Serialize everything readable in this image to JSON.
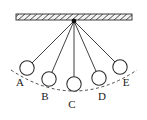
{
  "figure": {
    "type": "physics-diagram",
    "width": 147,
    "height": 120,
    "background_color": "#ffffff"
  },
  "ceiling": {
    "name": "hatched support ceiling",
    "x": 16,
    "y": 14,
    "width": 116,
    "height": 6,
    "hatch_direction": "lower-left-to-upper-right",
    "hatch_spacing": 6,
    "line_color": "#2b2b2b",
    "fill_color": "#f2f2f2"
  },
  "pivot": {
    "name": "suspension point",
    "x": 74,
    "y": 21,
    "radius": 2.2,
    "color": "#111111"
  },
  "arc": {
    "name": "swing path",
    "style": "dashed",
    "color": "#3a3a3a",
    "dash_pattern": "3 2.6",
    "start_x": 11,
    "start_y": 70,
    "end_x": 137,
    "end_y": 70,
    "control_x": 74,
    "control_y": 112
  },
  "string_color": "#2b2b2b",
  "bob": {
    "radius": 7.2,
    "fill_color": "#ffffff",
    "stroke_color": "#2b2b2b"
  },
  "positions": [
    {
      "label": "A",
      "cx": 27,
      "cy": 68,
      "label_x": 20,
      "label_y": 86
    },
    {
      "label": "B",
      "cx": 49,
      "cy": 79,
      "label_x": 45,
      "label_y": 100
    },
    {
      "label": "C",
      "cx": 74,
      "cy": 84,
      "label_x": 72,
      "label_y": 108
    },
    {
      "label": "D",
      "cx": 99,
      "cy": 78,
      "label_x": 102,
      "label_y": 100
    },
    {
      "label": "E",
      "cx": 120,
      "cy": 67,
      "label_x": 126,
      "label_y": 86
    }
  ]
}
